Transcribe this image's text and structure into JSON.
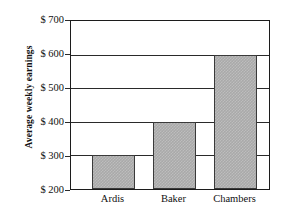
{
  "chart_data": {
    "type": "bar",
    "title": "",
    "subtitle": "",
    "xlabel": "",
    "ylabel": "Average weekly earnings",
    "categories": [
      "Ardis",
      "Baker",
      "Chambers"
    ],
    "values": [
      300,
      400,
      600
    ],
    "ylim": [
      200,
      700
    ],
    "y_ticks": [
      200,
      300,
      400,
      500,
      600,
      700
    ],
    "y_tick_labels": [
      "$ 200",
      "$ 300",
      "$ 400",
      "$ 500",
      "$ 600",
      "$ 700"
    ],
    "grid": true,
    "grid_axis": "y",
    "legend": false,
    "legend_position": "none",
    "bar_fill_color": "#a9a9a9",
    "bar_edge_color": "#3a3a3a",
    "axis_color": "#1c1c1c",
    "background_color": "#ffffff",
    "series": [
      {
        "name": "Average weekly earnings",
        "values": [
          300,
          400,
          600
        ]
      }
    ],
    "annotations": []
  },
  "axis": {
    "y_title": "Average weekly earnings",
    "tick_700": "$ 700",
    "tick_600": "$ 600",
    "tick_500": "$ 500",
    "tick_400": "$ 400",
    "tick_300": "$ 300",
    "tick_200": "$ 200"
  },
  "categories": {
    "cat_0": "Ardis",
    "cat_1": "Baker",
    "cat_2": "Chambers"
  }
}
